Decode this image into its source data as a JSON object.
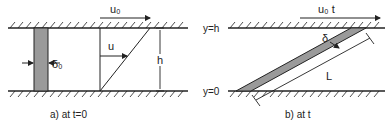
{
  "panel_a": {
    "velocity_label": "u₀",
    "profile_label": "u",
    "height_label": "h",
    "thickness_label": "δ₀",
    "caption": "a) at t=0"
  },
  "panel_b": {
    "velocity_label": "u₀ t",
    "top_label": "y=h",
    "bottom_label": "y=0",
    "thickness_label": "δ",
    "length_label": "L",
    "caption": "b) at t"
  },
  "colors": {
    "line": "#222222",
    "strip_fill": "#9a9a9a",
    "background": "#ffffff"
  }
}
